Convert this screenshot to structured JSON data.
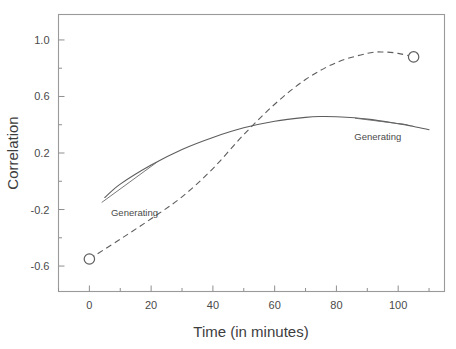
{
  "chart_data": {
    "type": "line",
    "title": "",
    "xlabel": "Time (in minutes)",
    "ylabel": "Correlation",
    "xlim": [
      -10,
      115
    ],
    "ylim": [
      -0.78,
      1.18
    ],
    "grid": false,
    "legend_position": "inline-annotations",
    "x_ticks": [
      0,
      20,
      40,
      60,
      80,
      100
    ],
    "x_tick_labels": [
      "0",
      "20",
      "40",
      "60",
      "80",
      "100"
    ],
    "x_minor_ticks": [
      -10,
      10,
      30,
      50,
      70,
      90,
      110
    ],
    "y_ticks": [
      1.0,
      0.6,
      0.2,
      -0.2,
      -0.6
    ],
    "y_tick_labels": [
      "1.0",
      "0.6",
      "0.2",
      "-0.2",
      "-0.6"
    ],
    "y_minor_ticks": [
      0.8,
      0.4,
      0.0,
      -0.4
    ],
    "series": [
      {
        "name": "Generating",
        "style": "solid",
        "label_text": "Generating",
        "label_x": 7,
        "label_y": -0.215,
        "marker": "none",
        "x": [
          5,
          10,
          20,
          30,
          40,
          50,
          60,
          70,
          75,
          80,
          90,
          100,
          105,
          110
        ],
        "values": [
          -0.115,
          -0.02,
          0.115,
          0.225,
          0.31,
          0.378,
          0.425,
          0.452,
          0.458,
          0.456,
          0.44,
          0.408,
          0.388,
          0.365
        ]
      },
      {
        "name": "Generating",
        "style": "dashed",
        "label_text": "Generating",
        "label_x": 101,
        "label_y": 0.32,
        "marker": "open-circle",
        "x": [
          0,
          10,
          20,
          30,
          40,
          50,
          60,
          70,
          80,
          90,
          95,
          100,
          105
        ],
        "values": [
          -0.55,
          -0.41,
          -0.265,
          -0.11,
          0.09,
          0.33,
          0.545,
          0.72,
          0.84,
          0.905,
          0.915,
          0.905,
          0.88
        ]
      }
    ],
    "markers": [
      {
        "series": "dashed",
        "x": 0,
        "y": -0.55,
        "shape": "open-circle"
      },
      {
        "series": "dashed",
        "x": 105,
        "y": 0.88,
        "shape": "open-circle"
      }
    ],
    "annotations": [
      {
        "text": "Generating",
        "x": 7,
        "y": -0.215,
        "points_to_series": "solid"
      },
      {
        "text": "Generating",
        "x": 101,
        "y": 0.32,
        "points_to_series": "solid"
      }
    ]
  },
  "colors": {
    "background": "#ffffff",
    "frame": "#9a9a9a",
    "curve": "#5d5d5d",
    "text": "#3d3d3d",
    "tick_text": "#4a4a4a"
  }
}
